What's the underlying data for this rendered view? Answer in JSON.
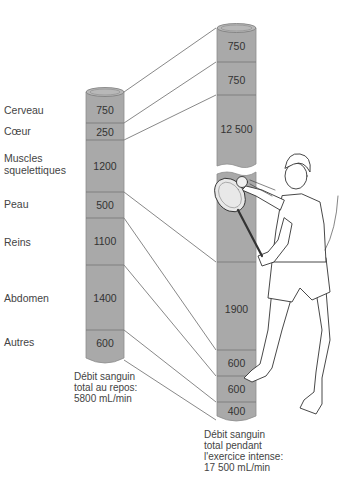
{
  "colors": {
    "tube_fill": "#a9a9a9",
    "tube_edge": "#8e8e8e",
    "divider": "#6e6e6e",
    "line": "#555555",
    "text": "#444444"
  },
  "organs": [
    {
      "label": "Cerveau",
      "rest": "750",
      "exercise": "750"
    },
    {
      "label": "Cœur",
      "rest": "250",
      "exercise": "750"
    },
    {
      "label": "Muscles squelettiques",
      "rest": "1200",
      "exercise": "12 500"
    },
    {
      "label": "Peau",
      "rest": "500",
      "exercise": "1900"
    },
    {
      "label": "Reins",
      "rest": "1100",
      "exercise": "600"
    },
    {
      "label": "Abdomen",
      "rest": "1400",
      "exercise": "600"
    },
    {
      "label": "Autres",
      "rest": "600",
      "exercise": "400"
    }
  ],
  "labels": {
    "cerveau": "Cerveau",
    "coeur": "Cœur",
    "muscles_1": "Muscles",
    "muscles_2": "squelettiques",
    "peau": "Peau",
    "reins": "Reins",
    "abdomen": "Abdomen",
    "autres": "Autres"
  },
  "rest_values": [
    "750",
    "250",
    "1200",
    "500",
    "1100",
    "1400",
    "600"
  ],
  "exercise_values": [
    "750",
    "750",
    "12 500",
    "1900",
    "600",
    "600",
    "400"
  ],
  "captions": {
    "rest": "Débit sanguin\ntotal au repos:\n5800 mL/min",
    "exercise": "Débit sanguin\ntotal pendant\nl'exercice intense:\n17 500 mL/min"
  },
  "illustration": "tennis-player"
}
